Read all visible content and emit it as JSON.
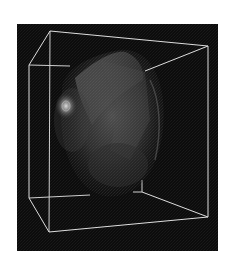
{
  "figure": {
    "caption": "3D volume rendering inside wireframe bounding box",
    "background_color": "#0c0c0c",
    "page_color": "#ffffff",
    "wireframe_color": "#d8d8d8",
    "frame": {
      "x": 17,
      "y": 24,
      "width": 201,
      "height": 227
    },
    "bounding_box": {
      "back_top_left": [
        50,
        31
      ],
      "back_top_right": [
        208,
        46
      ],
      "back_bottom_left": [
        49,
        232
      ],
      "back_bottom_right": [
        208,
        217
      ],
      "front_top_left": [
        29,
        65
      ],
      "front_bottom_left": [
        29,
        198
      ],
      "inner_bottom_vertex": [
        142,
        192
      ]
    },
    "object": {
      "description": "semi-transparent grayscale volumetric shape",
      "center": [
        112,
        128
      ],
      "bright_spot": [
        66,
        106
      ]
    }
  }
}
